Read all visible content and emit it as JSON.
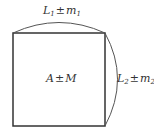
{
  "diagram": {
    "type": "square with arc-dimensioned sides",
    "labels": {
      "top": {
        "var": "L",
        "var_sub": "1",
        "op": "±",
        "err": "m",
        "err_sub": "1"
      },
      "right": {
        "var": "L",
        "var_sub": "2",
        "op": "±",
        "err": "m",
        "err_sub": "2"
      },
      "center": {
        "var": "A",
        "op": "±",
        "err": "M"
      }
    },
    "colors": {
      "stroke": "#333333",
      "arc": "#555555",
      "text": "#333333",
      "background": "#ffffff"
    }
  }
}
